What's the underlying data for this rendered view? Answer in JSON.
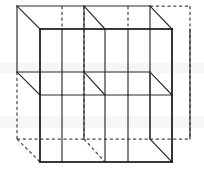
{
  "figure": {
    "projection": "oblique",
    "divisions": 2,
    "small_cube_count": 8,
    "colors": {
      "background": "#ffffff",
      "visible_edge": "#1c1c1c",
      "interior_edge": "#2a2a2a",
      "hidden_edge": "#4a4a4a"
    },
    "geometry": {
      "front_left_x": 40,
      "front_mid_x": 105,
      "front_right_x": 172,
      "back_left_x": 17,
      "back_mid_x": 84,
      "back_right_x": 150,
      "extra_right_x": 190,
      "extra_mid_x": 62,
      "extra_mid2_x": 128,
      "front_top_y": 29,
      "front_mid_y": 95,
      "front_bottom_y": 162,
      "back_top_y": 6,
      "back_mid_y": 72,
      "back_bottom_y": 139,
      "depth_dx": -23,
      "depth_dy": -23
    },
    "edges_solid": [
      [
        40,
        29,
        172,
        29
      ],
      [
        40,
        29,
        40,
        162
      ],
      [
        172,
        29,
        172,
        162
      ],
      [
        40,
        162,
        172,
        162
      ],
      [
        40,
        95,
        172,
        95
      ],
      [
        105,
        29,
        105,
        162
      ],
      [
        40,
        29,
        17,
        6
      ],
      [
        172,
        29,
        150,
        6
      ],
      [
        172,
        162,
        150,
        139
      ],
      [
        105,
        29,
        84,
        6
      ],
      [
        40,
        95,
        17,
        72
      ],
      [
        105,
        95,
        84,
        72
      ],
      [
        172,
        95,
        150,
        72
      ],
      [
        17,
        6,
        150,
        6
      ],
      [
        17,
        6,
        17,
        72
      ],
      [
        150,
        6,
        150,
        139
      ],
      [
        17,
        72,
        150,
        72
      ],
      [
        84,
        6,
        84,
        72
      ],
      [
        62,
        29,
        62,
        95
      ],
      [
        128,
        29,
        128,
        95
      ],
      [
        62,
        95,
        62,
        162
      ],
      [
        128,
        95,
        128,
        162
      ],
      [
        190,
        29,
        190,
        95
      ],
      [
        190,
        95,
        190,
        139
      ],
      [
        150,
        72,
        150,
        139
      ],
      [
        84,
        72,
        84,
        139
      ]
    ],
    "edges_hidden": [
      [
        17,
        72,
        17,
        139
      ],
      [
        17,
        139,
        150,
        139
      ],
      [
        17,
        139,
        40,
        162
      ],
      [
        84,
        139,
        105,
        162
      ],
      [
        150,
        139,
        190,
        139
      ],
      [
        190,
        6,
        190,
        139
      ],
      [
        150,
        6,
        190,
        6
      ],
      [
        84,
        6,
        84,
        139
      ],
      [
        62,
        6,
        62,
        29
      ],
      [
        128,
        6,
        128,
        29
      ]
    ]
  }
}
